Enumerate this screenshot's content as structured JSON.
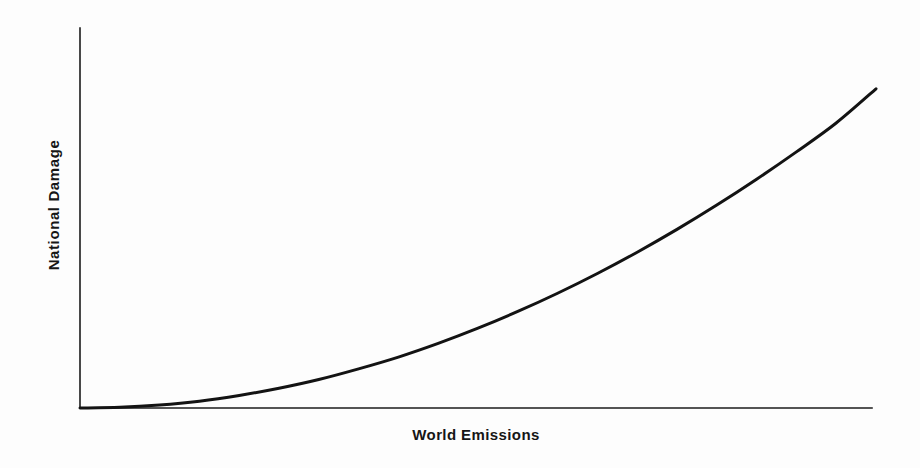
{
  "chart_data": {
    "type": "line",
    "title": "",
    "subtitle": "",
    "xlabel": "World Emissions",
    "ylabel": "National Damage",
    "grid": false,
    "legend": null,
    "legend_position": "none",
    "xlim": [
      0,
      1
    ],
    "ylim": [
      0,
      1
    ],
    "xticks": [],
    "yticks": [],
    "xtick_labels": [],
    "ytick_labels": [],
    "annotations": [],
    "series": [
      {
        "name": "National damage function",
        "color": "#131313",
        "linewidth": 3,
        "x": [
          0.0,
          0.05,
          0.1,
          0.15,
          0.2,
          0.25,
          0.3,
          0.35,
          0.4,
          0.45,
          0.5,
          0.55,
          0.6,
          0.65,
          0.7,
          0.75,
          0.8,
          0.85,
          0.9,
          0.95,
          1.0
        ],
        "y": [
          0.0,
          0.002,
          0.008,
          0.018,
          0.033,
          0.052,
          0.075,
          0.103,
          0.134,
          0.17,
          0.21,
          0.254,
          0.302,
          0.354,
          0.41,
          0.47,
          0.534,
          0.602,
          0.674,
          0.75,
          0.84
        ]
      }
    ]
  },
  "axes": {
    "yaxis_name": "vertical-axis-line",
    "xaxis_name": "horizontal-axis-line",
    "axis_color": "#1b1b1b"
  },
  "figure": {
    "background_color": "#fdfdfd",
    "width": 920,
    "height": 468
  }
}
